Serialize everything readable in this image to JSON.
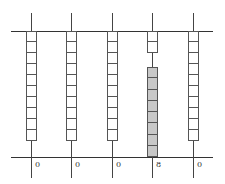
{
  "diagram": {
    "type": "abacus-place-value",
    "columns": [
      {
        "value": 0,
        "label": "0",
        "unused_beads": 10,
        "counted_beads": 0
      },
      {
        "value": 0,
        "label": "0",
        "unused_beads": 10,
        "counted_beads": 0
      },
      {
        "value": 0,
        "label": "0",
        "unused_beads": 10,
        "counted_beads": 0
      },
      {
        "value": 8,
        "label": "8",
        "unused_beads": 2,
        "counted_beads": 8
      },
      {
        "value": 0,
        "label": "0",
        "unused_beads": 10,
        "counted_beads": 0
      }
    ],
    "number": "00080",
    "colors": {
      "bead_off": "#ffffff",
      "bead_on": "#c8c8c8",
      "line": "#444444"
    }
  }
}
